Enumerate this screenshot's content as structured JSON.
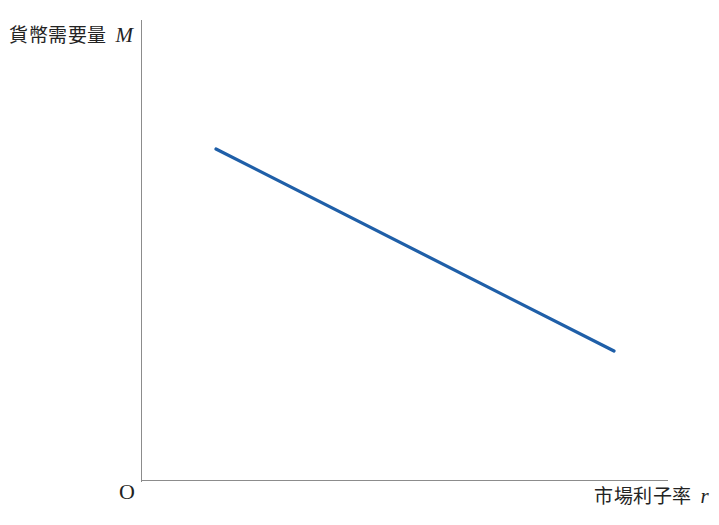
{
  "figure": {
    "background_color": "#ffffff",
    "axis_color": "#8c8c8c",
    "text_color": "#232323",
    "origin_label": "O"
  },
  "axes": {
    "y": {
      "label_text": "貨幣需要量",
      "symbol": "M"
    },
    "x": {
      "label_text": "市場利子率",
      "symbol": "r"
    }
  },
  "chart_data": {
    "type": "line",
    "title": "",
    "xlabel": "市場利子率 r",
    "ylabel": "貨幣需要量 M",
    "grid": false,
    "legend": false,
    "axis_arrows": false,
    "origin_label": "O",
    "xlim": [
      0,
      100
    ],
    "ylim": [
      0,
      100
    ],
    "series": [
      {
        "name": "貨幣需要曲線",
        "color": "#1f5fa8",
        "line_width": 3.2,
        "x": [
          14.2,
          89.7
        ],
        "y": [
          71.8,
          28.0
        ],
        "points_px": [
          {
            "x": 216,
            "y": 149
          },
          {
            "x": 614,
            "y": 351
          }
        ],
        "description": "右下がりの直線（貨幣需要量は市場利子率の減少関数）"
      }
    ],
    "annotations": []
  }
}
